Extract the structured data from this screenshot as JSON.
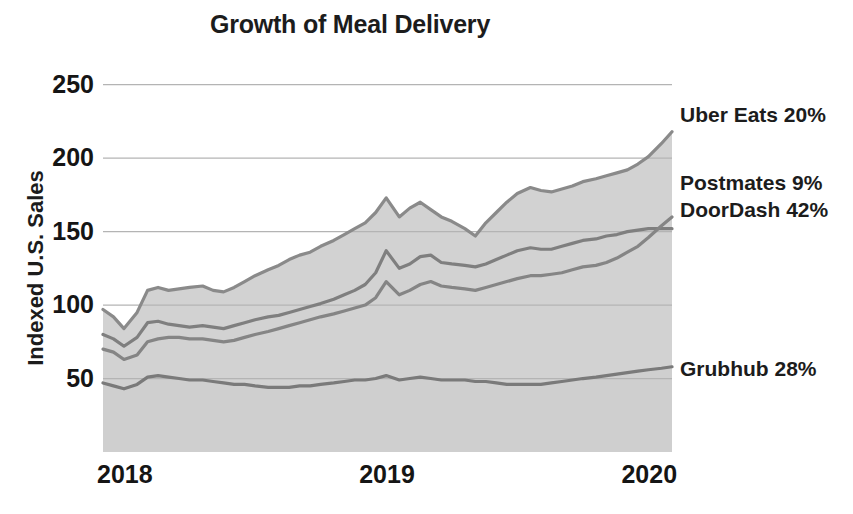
{
  "chart_data": {
    "type": "area",
    "title": "Growth of Meal Delivery",
    "xlabel": "",
    "ylabel": "Indexed U.S. Sales",
    "ylim": [
      0,
      260
    ],
    "yticks": [
      50,
      100,
      150,
      200,
      250
    ],
    "xticks": [
      "2018",
      "2019",
      "2020"
    ],
    "xlim": [
      2018.0,
      2020.17
    ],
    "grid": true,
    "legend_position": "right-inline",
    "stacked": false,
    "x": [
      2018.0,
      2018.04,
      2018.08,
      2018.13,
      2018.17,
      2018.21,
      2018.25,
      2018.29,
      2018.33,
      2018.38,
      2018.42,
      2018.46,
      2018.5,
      2018.54,
      2018.58,
      2018.63,
      2018.67,
      2018.71,
      2018.75,
      2018.79,
      2018.83,
      2018.88,
      2018.92,
      2018.96,
      2019.0,
      2019.04,
      2019.08,
      2019.13,
      2019.17,
      2019.21,
      2019.25,
      2019.29,
      2019.33,
      2019.38,
      2019.42,
      2019.46,
      2019.5,
      2019.54,
      2019.58,
      2019.63,
      2019.67,
      2019.71,
      2019.75,
      2019.79,
      2019.83,
      2019.88,
      2019.92,
      2019.96,
      2020.0,
      2020.04,
      2020.08,
      2020.13,
      2020.17
    ],
    "series": [
      {
        "name": "Uber Eats",
        "share": "20%",
        "label": "Uber Eats 20%",
        "color": "#8a8a8a",
        "values": [
          97,
          92,
          84,
          95,
          110,
          112,
          110,
          111,
          112,
          113,
          110,
          109,
          112,
          116,
          120,
          124,
          127,
          131,
          134,
          136,
          140,
          144,
          148,
          152,
          156,
          163,
          173,
          160,
          166,
          170,
          165,
          160,
          157,
          152,
          147,
          156,
          163,
          170,
          176,
          180,
          178,
          177,
          179,
          181,
          184,
          186,
          188,
          190,
          192,
          196,
          201,
          210,
          218
        ]
      },
      {
        "name": "Postmates",
        "share": "9%",
        "label": "Postmates 9%",
        "color": "#7f7f7f",
        "values": [
          80,
          77,
          72,
          78,
          88,
          89,
          87,
          86,
          85,
          86,
          85,
          84,
          86,
          88,
          90,
          92,
          93,
          95,
          97,
          99,
          101,
          104,
          107,
          110,
          114,
          122,
          137,
          125,
          128,
          133,
          134,
          129,
          128,
          127,
          126,
          128,
          131,
          134,
          137,
          139,
          138,
          138,
          140,
          142,
          144,
          145,
          147,
          148,
          150,
          151,
          152,
          152,
          152
        ]
      },
      {
        "name": "DoorDash",
        "share": "42%",
        "label": "DoorDash 42%",
        "color": "#858585",
        "values": [
          70,
          68,
          63,
          66,
          75,
          77,
          78,
          78,
          77,
          77,
          76,
          75,
          76,
          78,
          80,
          82,
          84,
          86,
          88,
          90,
          92,
          94,
          96,
          98,
          100,
          105,
          116,
          107,
          110,
          114,
          116,
          113,
          112,
          111,
          110,
          112,
          114,
          116,
          118,
          120,
          120,
          121,
          122,
          124,
          126,
          127,
          129,
          132,
          136,
          140,
          146,
          154,
          160
        ]
      },
      {
        "name": "Grubhub",
        "share": "28%",
        "label": "Grubhub 28%",
        "color": "#7a7a7a",
        "values": [
          47,
          45,
          43,
          46,
          51,
          52,
          51,
          50,
          49,
          49,
          48,
          47,
          46,
          46,
          45,
          44,
          44,
          44,
          45,
          45,
          46,
          47,
          48,
          49,
          49,
          50,
          52,
          49,
          50,
          51,
          50,
          49,
          49,
          49,
          48,
          48,
          47,
          46,
          46,
          46,
          46,
          47,
          48,
          49,
          50,
          51,
          52,
          53,
          54,
          55,
          56,
          57,
          58
        ]
      }
    ],
    "style": {
      "band_fill": "#d2d2d2",
      "plot_base_fill": "#cfcfcf",
      "grid_color": "#b4b4b4",
      "axis_text": "#151515",
      "title_color": "#1c1c1c",
      "background": "#ffffff"
    }
  },
  "labels": {
    "title": "Growth of Meal Delivery",
    "ylabel": "Indexed U.S. Sales",
    "yticks": [
      "50",
      "100",
      "150",
      "200",
      "250"
    ],
    "xticks": [
      "2018",
      "2019",
      "2020"
    ],
    "series_labels": [
      "Uber Eats 20%",
      "Postmates 9%",
      "DoorDash 42%",
      "Grubhub 28%"
    ]
  }
}
